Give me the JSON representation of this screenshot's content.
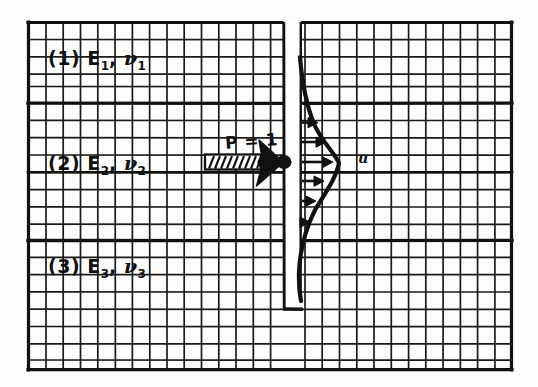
{
  "figure": {
    "background_color": "#fdfdfc",
    "ink_color": "#111111",
    "grid": {
      "left": 28,
      "top": 22,
      "right": 512,
      "bottom": 370,
      "cell_size": 17.3,
      "minor_line_color": "#1a1a1a",
      "minor_line_width": 1.6,
      "major_line_width": 3.2,
      "note": "hand drawn graph paper mesh"
    },
    "layers": [
      {
        "index": "1",
        "label": "(1) E₁, ν₁",
        "modulus_symbol": "E",
        "modulus_subscript": "1",
        "poisson_symbol": "ν",
        "poisson_subscript": "1",
        "prefix": "(1)",
        "top_y": 22,
        "bottom_y": 103
      },
      {
        "index": "2",
        "label": "(2) E₂, ν₂",
        "modulus_symbol": "E",
        "modulus_subscript": "2",
        "poisson_symbol": "ν",
        "poisson_subscript": "2",
        "prefix": "(2)",
        "top_y": 103,
        "bottom_y": 240
      },
      {
        "index": "3",
        "label": "(3) E₃, ν₃",
        "modulus_symbol": "E",
        "modulus_subscript": "3",
        "poisson_symbol": "ν",
        "poisson_subscript": "3",
        "prefix": "(3)",
        "top_y": 240,
        "bottom_y": 370
      }
    ],
    "interfaces_y": [
      103,
      240
    ],
    "pile": {
      "name": "pile",
      "left_x": 283,
      "right_x": 301,
      "top_y": 22,
      "bottom_y": 309,
      "fill": "#ffffff",
      "edge_color": "#111111"
    },
    "load": {
      "label": "P = 1",
      "symbol": "P",
      "value": "1",
      "arrow_y": 162,
      "arrow_tail_x": 205,
      "arrow_head_x": 283,
      "style": "hatched-block-arrow",
      "application_point_x": 283,
      "application_point_y": 162
    },
    "displacement": {
      "label": "u",
      "label_x": 358,
      "label_y": 155,
      "curve_description": "lateral deflection profile bulging right of pile",
      "arrow_count": 6,
      "arrows_y": [
        122,
        142,
        160,
        180,
        200,
        222
      ],
      "max_amplitude_x": 338,
      "curve_top_y": 58,
      "curve_bottom_y": 300
    }
  }
}
